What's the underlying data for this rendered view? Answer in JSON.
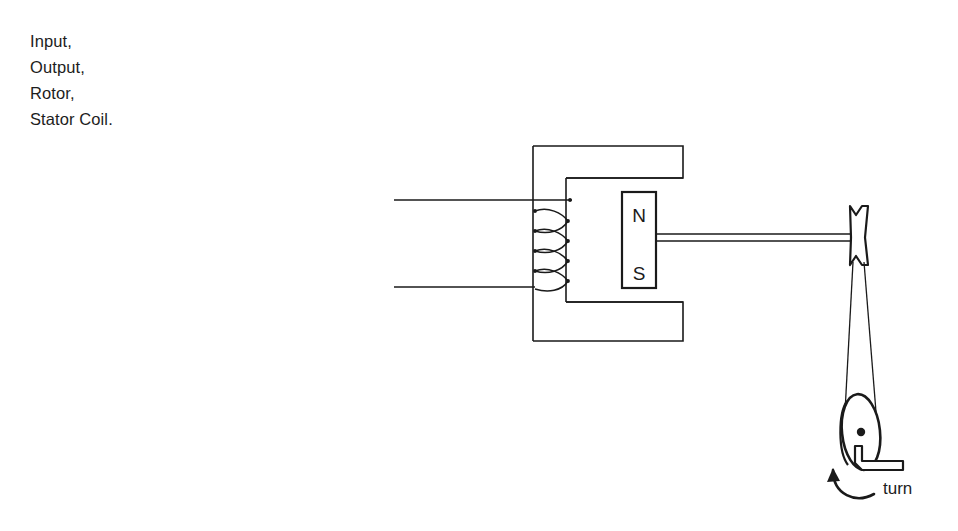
{
  "page": {
    "background_color": "#ffffff",
    "ink_color": "#1a1a1a",
    "width": 958,
    "height": 531
  },
  "label_list": {
    "items": [
      {
        "text": "Input,"
      },
      {
        "text": "Output,"
      },
      {
        "text": "Rotor,"
      },
      {
        "text": "Stator Coil."
      }
    ]
  },
  "diagram": {
    "magnet": {
      "north_label": "N",
      "south_label": "S"
    },
    "crank": {
      "label": "turn"
    },
    "parts": {
      "stator_core": "c-shaped-stator-core",
      "stator_coil": "coil-winding",
      "input_wire_top": "input-lead-top",
      "input_wire_bottom": "input-lead-bottom",
      "rotor_magnet": "bar-magnet-rotor",
      "shaft": "rotor-shaft",
      "pulley": "pulley-spool",
      "belt": "drive-belt",
      "hand_wheel": "hand-wheel",
      "axle_dot": "axle-center",
      "handle": "crank-handle",
      "rotation_arrow": "rotation-arrow"
    }
  }
}
